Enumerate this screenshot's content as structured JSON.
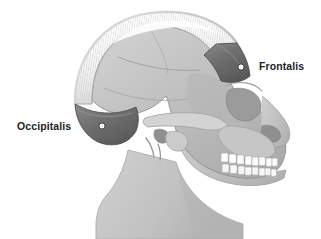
{
  "figure": {
    "name": "epicranius-muscle-lateral-skull",
    "background_color": "#ffffff",
    "view": "lateral right profile"
  },
  "labels": [
    {
      "id": "frontalis",
      "text": "Frontalis",
      "color": "#1d1d1f",
      "marker": {
        "cx": 241,
        "cy": 67,
        "r": 3.1
      },
      "x": 259,
      "y": 61
    },
    {
      "id": "occipitalis",
      "text": "Occipitalis",
      "color": "#1d1d1f",
      "marker": {
        "cx": 102,
        "cy": 126,
        "r": 3.1
      },
      "x": 17,
      "y": 121
    }
  ],
  "structures": {
    "galea_aponeurotica": {
      "name": "Galea aponeurotica",
      "fill": "#f6f6f6",
      "stroke": "#9a9a9a",
      "hatching": true
    },
    "frontalis_belly": {
      "name": "Frontalis muscle belly",
      "fill": "#6e6e6e",
      "stroke": "#4a4a4a"
    },
    "occipitalis_belly": {
      "name": "Occipitalis muscle belly",
      "fill": "#6e6e6e",
      "stroke": "#4a4a4a"
    },
    "cranium": {
      "name": "Cranium / skull bone",
      "fill": "#bcbcbc",
      "stroke": "#8a8a8a"
    },
    "neck": {
      "name": "Neck",
      "fill": "#c4c4c4",
      "stroke": "#9a9a9a"
    },
    "teeth": {
      "name": "Teeth",
      "fill": "#fcfcfc",
      "stroke": "#a2a2a2",
      "upper_count": 8,
      "lower_count": 8
    },
    "orbit": {
      "name": "Orbital cavity",
      "fill": "#9b9b9b"
    },
    "nasal_aperture": {
      "name": "Nasal aperture",
      "fill": "#8f8f8f"
    },
    "zygomatic_arch": {
      "name": "Zygomatic arch",
      "fill": "#cdcdcd"
    },
    "external_acoustic_meatus": {
      "name": "External acoustic meatus",
      "fill": "#8c8c8c"
    },
    "mastoid_process": {
      "name": "Mastoid process",
      "fill": "#c9c9c9"
    },
    "coronal_suture": {
      "name": "Coronal suture",
      "stroke": "#9d9d9d"
    },
    "squamous_suture": {
      "name": "Squamous suture",
      "stroke": "#9d9d9d"
    }
  },
  "palette": {
    "background": "#ffffff",
    "muscle_dark": "#6e6e6e",
    "aponeurosis_light": "#f6f6f6",
    "bone_mid": "#bcbcbc",
    "bone_shadow": "#8f8f8f",
    "outline": "#8a8a8a",
    "text": "#1d1d1f",
    "marker_fill": "#ffffff",
    "marker_stroke": "#3a3a3a"
  }
}
